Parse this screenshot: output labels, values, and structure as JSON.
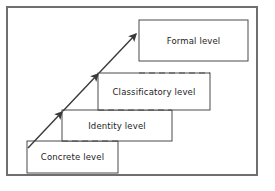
{
  "figure": {
    "frame": {
      "border_color": "#6f6f6f",
      "background_color": "#ffffff"
    },
    "box_stroke_color": "#4a4a4a",
    "arrow_color": "#3a3a3a",
    "text_color": "#1c1c1c"
  },
  "chart_data": {
    "type": "diagram",
    "title": "",
    "levels": [
      {
        "label": "Concrete level",
        "order": 1,
        "x": 27,
        "y": 141,
        "width": 91,
        "height": 32,
        "label_cx": 72.5,
        "label_cy": 157,
        "overlap_dash_from": 62,
        "overlap_dash_to": 118
      },
      {
        "label": "Identity level",
        "order": 2,
        "x": 62,
        "y": 110,
        "width": 110,
        "height": 31,
        "label_cx": 117,
        "label_cy": 125.5,
        "overlap_dash_from": 98,
        "overlap_dash_to": 172
      },
      {
        "label": "Classificatory level",
        "order": 3,
        "x": 98,
        "y": 73,
        "width": 112,
        "height": 37,
        "label_cx": 154,
        "label_cy": 91.5,
        "overlap_dash_from": 139,
        "overlap_dash_to": 210
      },
      {
        "label": "Formal level",
        "order": 4,
        "x": 139,
        "y": 20,
        "width": 109,
        "height": 41,
        "label_cx": 193.5,
        "label_cy": 40.5,
        "overlap_dash_from": 0,
        "overlap_dash_to": 0
      }
    ],
    "arrows": [
      {
        "name": "arrow-concrete-to-identity",
        "x1": 28,
        "y1": 148,
        "x2": 62,
        "y2": 112
      },
      {
        "name": "arrow-identity-to-classificatory",
        "x1": 63,
        "y1": 111,
        "x2": 98,
        "y2": 74
      },
      {
        "name": "arrow-classificatory-to-formal",
        "x1": 99,
        "y1": 73,
        "x2": 136,
        "y2": 34
      }
    ]
  }
}
